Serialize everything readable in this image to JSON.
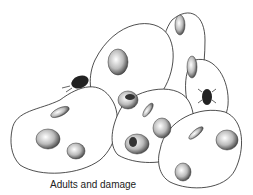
{
  "illustration": {
    "subject": "beans with insect damage",
    "caption": "Adults and damage"
  }
}
